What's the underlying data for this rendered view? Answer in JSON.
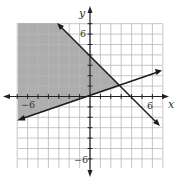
{
  "chart_data": {
    "type": "area",
    "title": "",
    "xlabel": "x",
    "ylabel": "y",
    "xlim": [
      -7,
      7
    ],
    "ylim": [
      -7,
      7
    ],
    "grid": true,
    "grid_step": 1,
    "tick_labels": {
      "x": [
        {
          "value": -6,
          "label": "−6"
        },
        {
          "value": 6,
          "label": "6"
        }
      ],
      "y": [
        {
          "value": 6,
          "label": "6"
        },
        {
          "value": -6,
          "label": "−6"
        }
      ]
    },
    "series": [
      {
        "name": "boundary-1",
        "equation": "y = x/3",
        "style": "solid",
        "points": [
          [
            -6.9,
            -2.3
          ],
          [
            6.8,
            2.27
          ]
        ]
      },
      {
        "name": "boundary-2",
        "equation": "y = -x + 4",
        "style": "solid",
        "points": [
          [
            -3.2,
            7.2
          ],
          [
            6.7,
            -2.7
          ]
        ]
      }
    ],
    "shaded_region": {
      "description": "y ≥ x/3 and y ≤ -x + 4",
      "vertices": [
        [
          -6.9,
          7.2
        ],
        [
          -3.2,
          7.2
        ],
        [
          3,
          1
        ],
        [
          -6.9,
          -2.3
        ]
      ],
      "color": "#a8a8a8"
    },
    "intersection": [
      3,
      1
    ]
  },
  "labels": {
    "x_axis": "x",
    "y_axis": "y",
    "x_neg6": "−6",
    "x_pos6": "6",
    "y_pos6": "6",
    "y_neg6": "−6"
  },
  "colors": {
    "shade": "#a8a8a8",
    "grid": "#b5b5b5",
    "axis": "#222222",
    "line": "#1a1a1a"
  }
}
